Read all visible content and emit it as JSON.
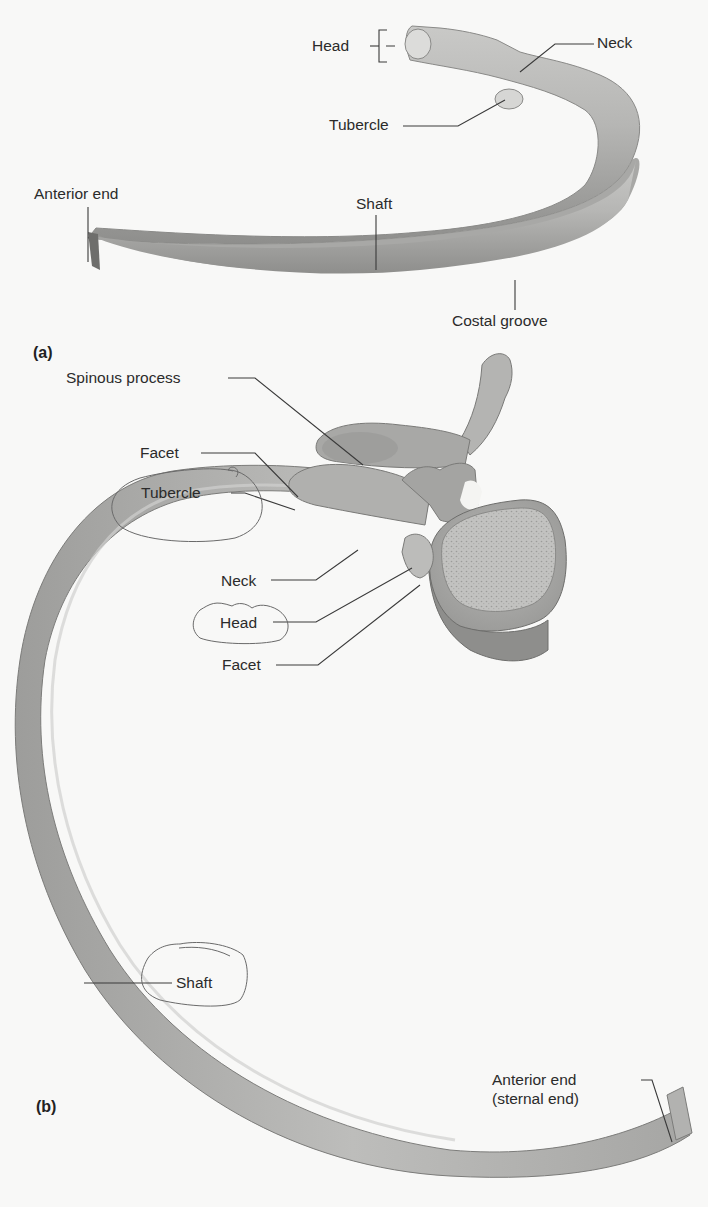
{
  "figure": {
    "panels": [
      {
        "id": "a",
        "label": "(a)",
        "labels": {
          "head": "Head",
          "neck": "Neck",
          "tubercle": "Tubercle",
          "anterior_end": "Anterior end",
          "shaft": "Shaft",
          "costal_groove": "Costal groove"
        }
      },
      {
        "id": "b",
        "label": "(b)",
        "labels": {
          "spinous_process": "Spinous process",
          "facet_upper": "Facet",
          "tubercle": "Tubercle",
          "neck": "Neck",
          "head": "Head",
          "facet_lower": "Facet",
          "shaft": "Shaft",
          "anterior_end_line1": "Anterior end",
          "anterior_end_line2": "(sternal end)"
        }
      }
    ],
    "annotations": {
      "circled_labels": [
        "Tubercle",
        "Head",
        "Shaft"
      ],
      "annotation_color": "#6a6a6a"
    },
    "colors": {
      "bone_light": "#d4d4d2",
      "bone_mid": "#aeaeac",
      "bone_dark": "#7c7c7a",
      "leader_line": "#3a3a3a",
      "background": "#f8f8f7"
    }
  }
}
